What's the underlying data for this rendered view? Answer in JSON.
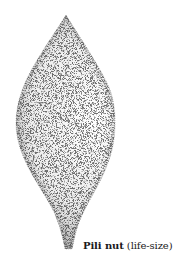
{
  "figure": {
    "caption": {
      "name": "Pili nut",
      "note": "(life-size)"
    },
    "style": {
      "ink_color": "#3a3a3a",
      "background": "#ffffff"
    }
  }
}
